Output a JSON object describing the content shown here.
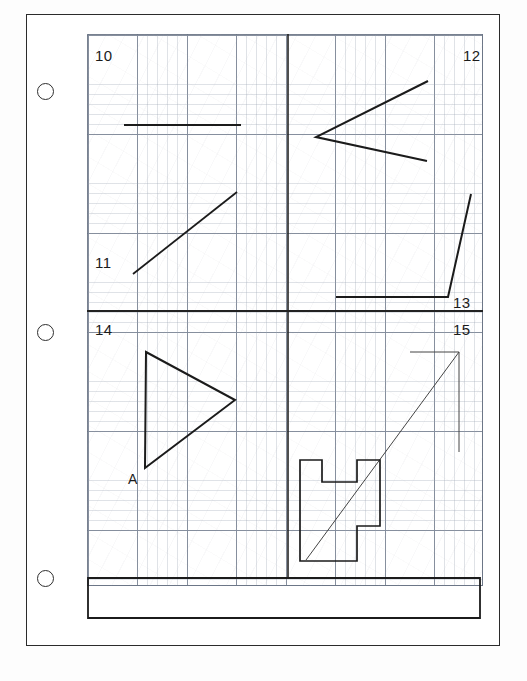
{
  "document": {
    "kind": "scanned-worksheet",
    "title": "Graph paper exercise sheet",
    "paper_color": "#ffffff",
    "ink_color": "#1b1b1b",
    "grid_color": "#69738 4",
    "caption_fragment": "           "
  },
  "binder_holes": [
    {
      "name": "hole-top",
      "cx": 45,
      "cy": 91
    },
    {
      "name": "hole-middle",
      "cx": 45,
      "cy": 332
    },
    {
      "name": "hole-bottom",
      "cx": 45,
      "cy": 578
    }
  ],
  "grid": {
    "left": 87,
    "top": 34,
    "width": 396,
    "height": 552,
    "major_spacing": 49.5,
    "minor_spacing": 9.9,
    "show_minor": true,
    "show_major": true
  },
  "quadrants": [
    {
      "id": "q10",
      "label": "10",
      "x": 95,
      "y": 48,
      "align": "left"
    },
    {
      "id": "q12",
      "label": "12",
      "x": 463,
      "y": 48,
      "align": "right"
    },
    {
      "id": "q11",
      "label": "11",
      "x": 95,
      "y": 255,
      "align": "left"
    },
    {
      "id": "q13",
      "label": "13",
      "x": 453,
      "y": 295,
      "align": "right"
    },
    {
      "id": "q14",
      "label": "14",
      "x": 95,
      "y": 322,
      "align": "left"
    },
    {
      "id": "q15",
      "label": "15",
      "x": 453,
      "y": 322,
      "align": "right"
    }
  ],
  "vertex_labels": [
    {
      "id": "a-label",
      "text": "A",
      "x": 128,
      "y": 472
    }
  ],
  "chart_data": {
    "type": "line",
    "xlabel": "",
    "ylabel": "",
    "grid": true,
    "legend": "none",
    "xlim": [
      87,
      483
    ],
    "ylim": [
      34,
      586
    ],
    "annotations": [
      "10",
      "11",
      "12",
      "13",
      "14",
      "15",
      "A"
    ],
    "series": [
      {
        "name": "divider-vertical",
        "kind": "polyline",
        "stroke": "#222222",
        "stroke_width": 1.6,
        "points": [
          [
            288,
            34
          ],
          [
            288,
            578
          ]
        ]
      },
      {
        "name": "divider-horizontal",
        "kind": "polyline",
        "stroke": "#222222",
        "stroke_width": 1.8,
        "points": [
          [
            87,
            311
          ],
          [
            483,
            311
          ]
        ]
      },
      {
        "name": "figure-10-horizontal-segment",
        "kind": "polyline",
        "stroke": "#1b1b1b",
        "stroke_width": 2.2,
        "points": [
          [
            124,
            125
          ],
          [
            241,
            125
          ]
        ]
      },
      {
        "name": "figure-11-diagonal-segment",
        "kind": "polyline",
        "stroke": "#1b1b1b",
        "stroke_width": 1.8,
        "points": [
          [
            133,
            274
          ],
          [
            237,
            192
          ]
        ]
      },
      {
        "name": "figure-12-chevron",
        "kind": "polyline",
        "stroke": "#1b1b1b",
        "stroke_width": 2.0,
        "points": [
          [
            428,
            81
          ],
          [
            316,
            137
          ],
          [
            427,
            161
          ]
        ]
      },
      {
        "name": "figure-13-bent-line",
        "kind": "polyline",
        "stroke": "#1b1b1b",
        "stroke_width": 2.0,
        "points": [
          [
            336,
            297
          ],
          [
            448,
            297
          ],
          [
            471,
            194
          ]
        ]
      },
      {
        "name": "figure-14-triangle",
        "kind": "polygon",
        "stroke": "#1b1b1b",
        "stroke_width": 2.0,
        "points": [
          [
            146,
            352
          ],
          [
            235,
            400
          ],
          [
            145,
            468
          ]
        ]
      },
      {
        "name": "figure-15-diagonal-with-caps",
        "kind": "polyline",
        "stroke": "#444444",
        "stroke_width": 1.0,
        "points": [
          [
            410,
            352
          ],
          [
            459,
            352
          ],
          [
            306,
            560
          ]
        ]
      },
      {
        "name": "figure-15-right-tick",
        "kind": "polyline",
        "stroke": "#444444",
        "stroke_width": 1.0,
        "points": [
          [
            459,
            352
          ],
          [
            459,
            452
          ]
        ]
      },
      {
        "name": "figure-15-stepped-polygon",
        "kind": "polygon",
        "stroke": "#1b1b1b",
        "stroke_width": 1.7,
        "points": [
          [
            300,
            460
          ],
          [
            322,
            460
          ],
          [
            322,
            482
          ],
          [
            357,
            482
          ],
          [
            357,
            460
          ],
          [
            380,
            460
          ],
          [
            380,
            526
          ],
          [
            357,
            526
          ],
          [
            357,
            548
          ],
          [
            357,
            561
          ],
          [
            300,
            561
          ]
        ]
      },
      {
        "name": "bottom-bar-rectangle",
        "kind": "polygon",
        "stroke": "#1b1b1b",
        "stroke_width": 1.8,
        "points": [
          [
            88,
            578
          ],
          [
            480,
            578
          ],
          [
            480,
            618
          ],
          [
            88,
            618
          ]
        ]
      }
    ]
  }
}
